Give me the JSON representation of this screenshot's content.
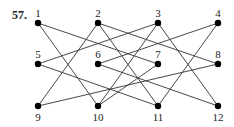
{
  "problem": {
    "number": "57."
  },
  "graph": {
    "nodes": [
      {
        "id": "1",
        "x": 38,
        "y": 23,
        "label_pos": "above"
      },
      {
        "id": "2",
        "x": 98,
        "y": 23,
        "label_pos": "above"
      },
      {
        "id": "3",
        "x": 158,
        "y": 23,
        "label_pos": "above"
      },
      {
        "id": "4",
        "x": 218,
        "y": 23,
        "label_pos": "above"
      },
      {
        "id": "5",
        "x": 38,
        "y": 64,
        "label_pos": "above"
      },
      {
        "id": "6",
        "x": 98,
        "y": 64,
        "label_pos": "above"
      },
      {
        "id": "7",
        "x": 158,
        "y": 64,
        "label_pos": "above"
      },
      {
        "id": "8",
        "x": 218,
        "y": 64,
        "label_pos": "above"
      },
      {
        "id": "9",
        "x": 38,
        "y": 106,
        "label_pos": "below"
      },
      {
        "id": "10",
        "x": 98,
        "y": 106,
        "label_pos": "below"
      },
      {
        "id": "11",
        "x": 158,
        "y": 106,
        "label_pos": "below"
      },
      {
        "id": "12",
        "x": 218,
        "y": 106,
        "label_pos": "below"
      }
    ],
    "edges": [
      [
        "1",
        "7"
      ],
      [
        "1",
        "10"
      ],
      [
        "2",
        "9"
      ],
      [
        "2",
        "8"
      ],
      [
        "2",
        "11"
      ],
      [
        "3",
        "5"
      ],
      [
        "3",
        "10"
      ],
      [
        "3",
        "12"
      ],
      [
        "4",
        "6"
      ],
      [
        "4",
        "11"
      ],
      [
        "5",
        "11"
      ],
      [
        "6",
        "12"
      ],
      [
        "7",
        "10"
      ],
      [
        "8",
        "9"
      ]
    ]
  }
}
